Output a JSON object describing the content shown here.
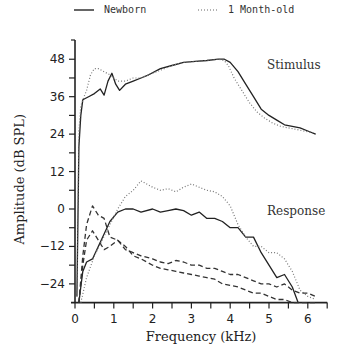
{
  "chart_data": {
    "type": "line",
    "title": "",
    "xlabel": "Frequency (kHz)",
    "ylabel": "Amplitude (dB SPL)",
    "xlim": [
      0,
      6.5
    ],
    "ylim": [
      -30,
      52
    ],
    "xticks": [
      0,
      1,
      2,
      3,
      4,
      5,
      6
    ],
    "xminor_step": 0.5,
    "yticks": [
      -24,
      -12,
      0,
      12,
      24,
      36,
      48
    ],
    "yminor_step": 6,
    "grid": false,
    "legend": {
      "position": "top",
      "entries": [
        {
          "label": "Newborn",
          "style": "solid"
        },
        {
          "label": "1 Month-old",
          "style": "dotted"
        }
      ]
    },
    "annotations": [
      {
        "text": "Stimulus",
        "x": 4.95,
        "y": 45
      },
      {
        "text": "Response",
        "x": 4.95,
        "y": -2
      }
    ],
    "series": [
      {
        "name": "Stimulus - Newborn",
        "group": "stimulus",
        "style": "solid",
        "x": [
          0.05,
          0.1,
          0.15,
          0.2,
          0.35,
          0.5,
          0.65,
          0.75,
          0.85,
          0.95,
          1.05,
          1.15,
          1.3,
          1.5,
          1.7,
          1.9,
          2.2,
          2.5,
          2.8,
          3.1,
          3.4,
          3.7,
          3.85,
          4.0,
          4.2,
          4.4,
          4.6,
          4.8,
          5.0,
          5.2,
          5.4,
          5.6,
          5.8,
          6.0,
          6.2
        ],
        "y": [
          -28,
          20,
          30,
          35,
          36,
          37,
          38.5,
          36.5,
          41,
          43.5,
          40,
          38,
          40,
          41,
          42,
          43,
          45,
          46,
          47,
          47.3,
          47.6,
          48,
          48,
          47,
          44,
          40,
          36,
          32,
          30,
          28.5,
          27,
          26.5,
          26,
          25,
          24
        ]
      },
      {
        "name": "Stimulus - 1 Month-old",
        "group": "stimulus",
        "style": "dotted",
        "x": [
          0.05,
          0.1,
          0.15,
          0.2,
          0.3,
          0.4,
          0.5,
          0.6,
          0.75,
          0.9,
          1.0,
          1.1,
          1.3,
          1.5,
          1.7,
          1.9,
          2.2,
          2.5,
          2.8,
          3.1,
          3.4,
          3.7,
          3.85,
          3.95,
          4.1,
          4.3,
          4.5,
          4.7,
          4.9,
          5.1,
          5.3,
          5.5,
          5.7,
          5.9,
          6.1,
          6.2
        ],
        "y": [
          -28,
          25,
          33,
          35,
          38,
          43,
          45,
          45,
          44,
          43,
          42,
          41,
          41,
          42,
          42,
          43,
          44.5,
          46,
          47,
          47.3,
          47.6,
          48,
          47.5,
          46,
          42,
          38,
          34,
          31,
          29,
          27.5,
          26.5,
          26,
          25.5,
          25,
          24.5,
          24
        ]
      },
      {
        "name": "Response - Newborn",
        "group": "response",
        "style": "solid",
        "x": [
          0.1,
          0.15,
          0.2,
          0.3,
          0.45,
          0.6,
          0.75,
          0.9,
          1.1,
          1.3,
          1.5,
          1.7,
          2.0,
          2.2,
          2.4,
          2.6,
          2.8,
          3.0,
          3.2,
          3.4,
          3.6,
          3.8,
          4.0,
          4.2,
          4.4,
          4.6,
          4.8,
          5.0,
          5.2,
          5.4,
          5.6,
          5.75
        ],
        "y": [
          -30,
          -25,
          -20,
          -17,
          -16,
          -12,
          -8,
          -4,
          -1,
          0,
          0,
          -1,
          0,
          -1,
          -0.5,
          0,
          -0.5,
          -2,
          -1,
          -3,
          -3,
          -4,
          -6,
          -6,
          -9,
          -9,
          -14,
          -18,
          -22,
          -21,
          -25,
          -30
        ]
      },
      {
        "name": "Response - 1 Month-old",
        "group": "response",
        "style": "dotted",
        "x": [
          0.15,
          0.3,
          0.5,
          0.7,
          0.9,
          1.1,
          1.3,
          1.5,
          1.7,
          2.0,
          2.2,
          2.4,
          2.6,
          2.8,
          3.0,
          3.2,
          3.4,
          3.6,
          3.8,
          4.0,
          4.2,
          4.4,
          4.6,
          4.8,
          5.0,
          5.2,
          5.4,
          5.6,
          5.8,
          6.0,
          6.2
        ],
        "y": [
          -30,
          -22,
          -15,
          -10,
          -5,
          0,
          4,
          6,
          9,
          7,
          6,
          6.5,
          5.5,
          7,
          8,
          7,
          6,
          5.5,
          4,
          1,
          -5,
          -9,
          -12,
          -12,
          -14,
          -14,
          -16,
          -20,
          -26,
          -28,
          -29
        ]
      },
      {
        "name": "Response - dashed 1",
        "group": "response",
        "style": "dashed",
        "x": [
          0.1,
          0.2,
          0.3,
          0.45,
          0.6,
          0.75,
          0.9,
          1.1,
          1.3,
          1.5,
          1.7,
          2.0,
          2.2,
          2.4,
          2.6,
          2.8,
          3.0,
          3.2,
          3.4,
          3.6,
          3.8,
          4.0,
          4.2,
          4.4,
          4.6,
          4.8,
          5.0,
          5.2,
          5.4,
          5.6,
          5.8,
          6.0,
          6.2
        ],
        "y": [
          -30,
          -15,
          -5,
          1,
          -2,
          -3,
          -9,
          -10,
          -13,
          -14,
          -15,
          -16,
          -17,
          -17.5,
          -16.5,
          -17,
          -18,
          -18,
          -19,
          -19,
          -20,
          -21,
          -21,
          -22,
          -23,
          -24,
          -24,
          -25,
          -24,
          -26,
          -27,
          -27,
          -28
        ]
      },
      {
        "name": "Response - dashed 2",
        "group": "response",
        "style": "dashed",
        "x": [
          0.1,
          0.2,
          0.3,
          0.45,
          0.6,
          0.75,
          0.9,
          1.1,
          1.3,
          1.5,
          1.7,
          2.0,
          2.2,
          2.4,
          2.6,
          2.8,
          3.0,
          3.2,
          3.4,
          3.6,
          3.8,
          4.0,
          4.2,
          4.4,
          4.6,
          4.8,
          5.0,
          5.2,
          5.4,
          5.6,
          5.8,
          6.0,
          6.2
        ],
        "y": [
          -30,
          -18,
          -10,
          -7,
          -10,
          -13,
          -12,
          -10,
          -12,
          -15,
          -16,
          -18,
          -19,
          -19.5,
          -20,
          -20.5,
          -21,
          -21.5,
          -22,
          -22.5,
          -24,
          -24.5,
          -25,
          -26,
          -27,
          -27,
          -28,
          -29,
          -29,
          -30,
          -30,
          -30,
          -30
        ]
      }
    ]
  }
}
